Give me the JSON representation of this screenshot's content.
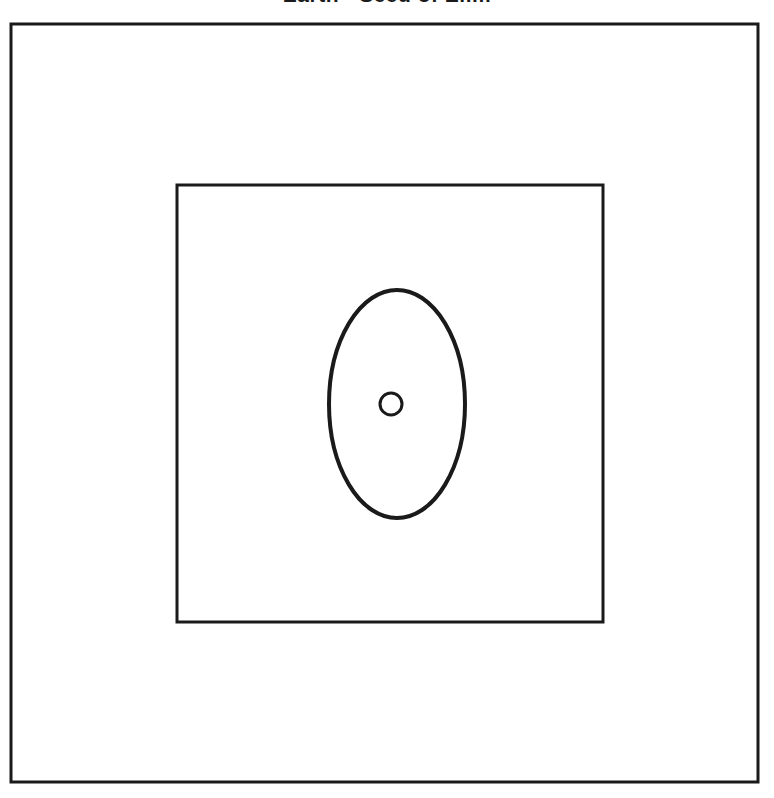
{
  "figure": {
    "title": "Earth - Seed of Elim",
    "background_color": "#ffffff",
    "stroke_color": "#1a1a1a"
  },
  "chart_data": {
    "type": "diagram",
    "title": "Earth - Seed of Elim",
    "shapes": [
      {
        "name": "outer-frame",
        "type": "rectangle",
        "x": 11,
        "y": 24,
        "width": 747,
        "height": 758,
        "stroke": "#1a1a1a",
        "stroke_width": 3,
        "fill": "none"
      },
      {
        "name": "inner-square",
        "type": "rectangle",
        "x": 177,
        "y": 185,
        "width": 426,
        "height": 437,
        "stroke": "#1a1a1a",
        "stroke_width": 3,
        "fill": "none"
      },
      {
        "name": "central-ellipse",
        "type": "ellipse",
        "cx": 397,
        "cy": 404,
        "rx": 68,
        "ry": 114,
        "stroke": "#1a1a1a",
        "stroke_width": 4,
        "fill": "none"
      },
      {
        "name": "center-dot",
        "type": "circle",
        "cx": 391,
        "cy": 404,
        "r": 11,
        "stroke": "#1a1a1a",
        "stroke_width": 3,
        "fill": "none"
      }
    ]
  }
}
